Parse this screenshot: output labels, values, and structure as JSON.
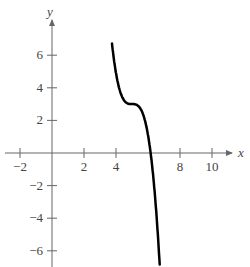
{
  "chart_data": {
    "type": "line",
    "title": "",
    "xlabel": "x",
    "ylabel": "y",
    "xlim": [
      -2.5,
      11
    ],
    "ylim": [
      -7,
      7.5
    ],
    "x_ticks": [
      -2,
      2,
      4,
      8,
      10
    ],
    "x_tick_labels": [
      "−2",
      "2",
      "4",
      "8",
      "10"
    ],
    "y_ticks": [
      6,
      4,
      2,
      -2,
      -4,
      -6
    ],
    "y_tick_labels": [
      "6",
      "4",
      "2",
      "−2",
      "−4",
      "−6"
    ],
    "grid": false,
    "legend": null,
    "series": [
      {
        "name": "f(x) = 3 - (x - 5)^3",
        "color": "#000000",
        "x": [
          3.75,
          4.0,
          4.25,
          4.5,
          4.75,
          5.0,
          5.25,
          5.5,
          5.75,
          6.0,
          6.25,
          6.5,
          6.75
        ],
        "y": [
          4.95,
          4.0,
          3.42,
          3.13,
          3.02,
          3.0,
          2.98,
          2.88,
          2.58,
          2.0,
          1.05,
          -0.38,
          -2.36
        ]
      }
    ]
  }
}
